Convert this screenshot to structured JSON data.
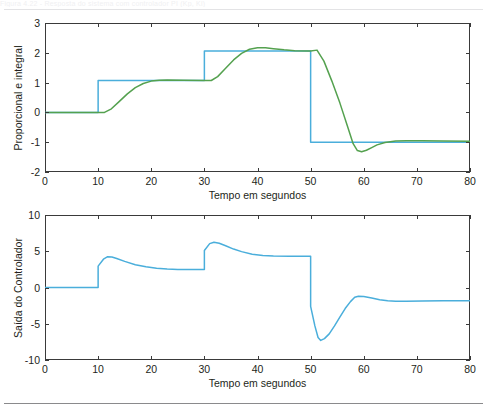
{
  "page": {
    "background": "#ffffff",
    "top_ghost_text": "Figura 4.22 - Resposta do sistema com controlador PI (Kp, Ki)",
    "rule_top_color": "#e3e3e5",
    "rule_bottom_color": "#8a8a8c"
  },
  "colors": {
    "reference_blue": "#4aaedb",
    "response_green": "#54a14f",
    "axis": "#3a3a3a",
    "text": "#231f20"
  },
  "chart_data": [
    {
      "id": "plot-top",
      "type": "line",
      "title": "",
      "xlabel": "Tempo em segundos",
      "ylabel": "Proporcional e integral",
      "xlim": [
        0,
        80
      ],
      "ylim": [
        -2,
        3
      ],
      "xticks": [
        0,
        10,
        20,
        30,
        40,
        50,
        60,
        70,
        80
      ],
      "yticks": [
        -2,
        -1,
        0,
        1,
        2,
        3
      ],
      "xtick_labels": [
        "0",
        "10",
        "20",
        "30",
        "40",
        "50",
        "60",
        "70",
        "80"
      ],
      "ytick_labels": [
        "-2",
        "-1",
        "0",
        "1",
        "2",
        "3"
      ],
      "grid": false,
      "legend": "none",
      "series": [
        {
          "name": "Referencia",
          "color": "#4aaedb",
          "style": "step",
          "points": [
            [
              0,
              0
            ],
            [
              10,
              0
            ],
            [
              10,
              1.07
            ],
            [
              30,
              1.07
            ],
            [
              30,
              2.06
            ],
            [
              50,
              2.06
            ],
            [
              50,
              -1.0
            ],
            [
              80,
              -1.0
            ]
          ]
        },
        {
          "name": "Saida do processo",
          "color": "#54a14f",
          "style": "line",
          "points": [
            [
              0,
              0
            ],
            [
              11.2,
              0
            ],
            [
              12.5,
              0.12
            ],
            [
              14,
              0.37
            ],
            [
              15.5,
              0.62
            ],
            [
              17,
              0.83
            ],
            [
              18.5,
              0.97
            ],
            [
              20,
              1.05
            ],
            [
              21.5,
              1.08
            ],
            [
              23,
              1.09
            ],
            [
              26,
              1.08
            ],
            [
              30,
              1.07
            ],
            [
              31.3,
              1.07
            ],
            [
              32.5,
              1.2
            ],
            [
              34,
              1.48
            ],
            [
              35.5,
              1.76
            ],
            [
              37,
              1.98
            ],
            [
              38.5,
              2.12
            ],
            [
              40,
              2.17
            ],
            [
              41.5,
              2.17
            ],
            [
              43,
              2.14
            ],
            [
              45,
              2.1
            ],
            [
              47,
              2.07
            ],
            [
              50,
              2.06
            ],
            [
              51.2,
              2.09
            ],
            [
              52.5,
              1.72
            ],
            [
              54,
              1.05
            ],
            [
              55.5,
              0.32
            ],
            [
              57,
              -0.5
            ],
            [
              58,
              -1.05
            ],
            [
              58.8,
              -1.28
            ],
            [
              59.6,
              -1.32
            ],
            [
              60.5,
              -1.27
            ],
            [
              61.5,
              -1.18
            ],
            [
              62.5,
              -1.09
            ],
            [
              64,
              -1.01
            ],
            [
              66,
              -0.96
            ],
            [
              68,
              -0.95
            ],
            [
              71,
              -0.95
            ],
            [
              75,
              -0.96
            ],
            [
              80,
              -0.97
            ]
          ]
        }
      ]
    },
    {
      "id": "plot-bottom",
      "type": "line",
      "title": "",
      "xlabel": "Tempo em segundos",
      "ylabel": "Saída do Controlador",
      "xlim": [
        0,
        80
      ],
      "ylim": [
        -10,
        10
      ],
      "xticks": [
        0,
        10,
        20,
        30,
        40,
        50,
        60,
        70,
        80
      ],
      "yticks": [
        -10,
        -5,
        0,
        5,
        10
      ],
      "xtick_labels": [
        "0",
        "10",
        "20",
        "30",
        "40",
        "50",
        "60",
        "70",
        "80"
      ],
      "ytick_labels": [
        "-10",
        "-5",
        "0",
        "5",
        "10"
      ],
      "grid": false,
      "legend": "none",
      "series": [
        {
          "name": "Saida do controlador",
          "color": "#4aaedb",
          "style": "line",
          "points": [
            [
              0,
              0
            ],
            [
              10,
              0
            ],
            [
              10,
              2.95
            ],
            [
              11,
              3.9
            ],
            [
              11.8,
              4.25
            ],
            [
              12.6,
              4.2
            ],
            [
              13.5,
              4.0
            ],
            [
              15,
              3.6
            ],
            [
              17,
              3.15
            ],
            [
              19,
              2.85
            ],
            [
              21,
              2.65
            ],
            [
              23,
              2.55
            ],
            [
              25,
              2.5
            ],
            [
              27,
              2.48
            ],
            [
              30,
              2.47
            ],
            [
              30,
              5.1
            ],
            [
              31,
              6.05
            ],
            [
              31.8,
              6.25
            ],
            [
              32.8,
              6.1
            ],
            [
              34,
              5.75
            ],
            [
              35.5,
              5.3
            ],
            [
              37,
              4.95
            ],
            [
              39,
              4.6
            ],
            [
              41,
              4.42
            ],
            [
              43,
              4.35
            ],
            [
              46,
              4.32
            ],
            [
              50,
              4.3
            ],
            [
              50,
              -2.6
            ],
            [
              50.8,
              -5.3
            ],
            [
              51.4,
              -6.9
            ],
            [
              51.9,
              -7.3
            ],
            [
              52.6,
              -7.05
            ],
            [
              53.5,
              -6.4
            ],
            [
              54.5,
              -5.3
            ],
            [
              55.5,
              -4.1
            ],
            [
              56.5,
              -2.9
            ],
            [
              57.5,
              -1.95
            ],
            [
              58.3,
              -1.35
            ],
            [
              59,
              -1.2
            ],
            [
              60,
              -1.25
            ],
            [
              61.5,
              -1.45
            ],
            [
              63,
              -1.68
            ],
            [
              64.5,
              -1.82
            ],
            [
              66,
              -1.88
            ],
            [
              68,
              -1.88
            ],
            [
              71,
              -1.85
            ],
            [
              75,
              -1.83
            ],
            [
              80,
              -1.82
            ]
          ]
        }
      ]
    }
  ]
}
